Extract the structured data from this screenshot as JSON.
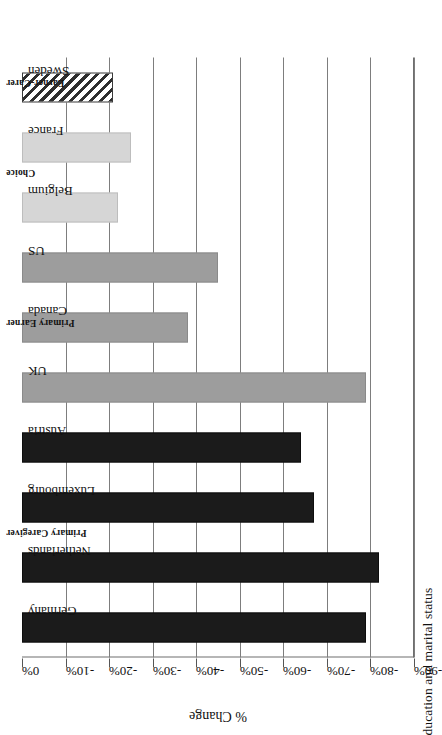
{
  "figure": {
    "caption_clipped": "ducation and marital status",
    "axis_title": "% Change"
  },
  "chart_data": {
    "type": "bar",
    "orientation": "horizontal",
    "title": "",
    "xlabel": "",
    "ylabel": "% Change",
    "ylim": [
      0,
      -90
    ],
    "grid": true,
    "legend": "none",
    "tick_labels": [
      "0%",
      "-10%",
      "-20%",
      "-30%",
      "-40%",
      "-50%",
      "-60%",
      "-70%",
      "-80%",
      "-90%"
    ],
    "tick_values": [
      0,
      -10,
      -20,
      -30,
      -40,
      -50,
      -60,
      -70,
      -80,
      -90
    ],
    "group_labels": [
      "Primary Caregiver",
      "Primary Earner",
      "Choice",
      "Earner-Carer"
    ],
    "categories": [
      "Germany",
      "Netherlands",
      "Luxembourg",
      "Austria",
      "UK",
      "Canada",
      "US",
      "Belgium",
      "France",
      "Sweden"
    ],
    "values": [
      -79,
      -82,
      -67,
      -64,
      -79,
      -38,
      -45,
      -22,
      -25,
      -21
    ],
    "groups": [
      "Primary Caregiver",
      "Primary Caregiver",
      "Primary Caregiver",
      "Primary Caregiver",
      "Primary Earner",
      "Primary Earner",
      "Primary Earner",
      "Choice",
      "Choice",
      "Earner-Carer"
    ],
    "fills": [
      "black",
      "black",
      "black",
      "black",
      "mid",
      "mid",
      "mid",
      "light",
      "light",
      "hatch"
    ],
    "colors": {
      "black": "#1b1b1b",
      "mid": "#9d9d9d",
      "light": "#d6d6d6",
      "hatch": "#2e2e2e",
      "axis": "#6f6f6f",
      "grid": "#7d7d7d"
    }
  }
}
